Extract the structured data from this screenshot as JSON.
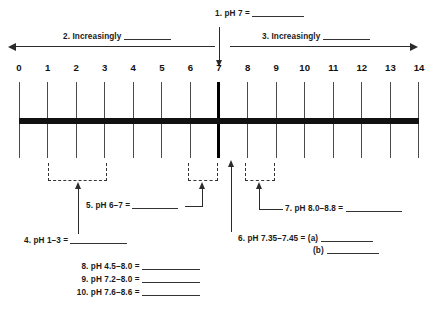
{
  "diagram": {
    "scale": {
      "ticks": [
        "0",
        "1",
        "2",
        "3",
        "4",
        "5",
        "6",
        "7",
        "8",
        "9",
        "10",
        "11",
        "12",
        "13",
        "14"
      ],
      "min": 0,
      "max": 14,
      "neutral_point": "7"
    },
    "top_labels": {
      "neutral": "1. pH 7 = ",
      "left_direction": "2. Increasingly ",
      "right_direction": "3. Increasingly "
    },
    "bracket_labels": {
      "item4": "4. pH 1–3 = ",
      "item5": "5. pH 6–7 = ",
      "item7": "7. pH 8.0–8.8 = "
    },
    "pointer_labels": {
      "item6_line1": "6. pH 7.35–7.45 = (a)",
      "item6_line2": "(b)"
    },
    "bottom_labels": [
      "8. pH 4.5–8.0 = ",
      "9. pH 7.2–8.0 = ",
      "10. pH 7.6–8.6 = "
    ],
    "brackets": [
      {
        "name": "ph-1-to-3",
        "from": 1,
        "to": 3
      },
      {
        "name": "ph-6-to-7",
        "from": 5.9,
        "to": 6.9
      },
      {
        "name": "ph-8-to-8.8",
        "from": 7.9,
        "to": 8.9
      }
    ],
    "colors": {
      "ink": "#111111",
      "line": "#2b2b2b",
      "background": "#ffffff"
    }
  }
}
